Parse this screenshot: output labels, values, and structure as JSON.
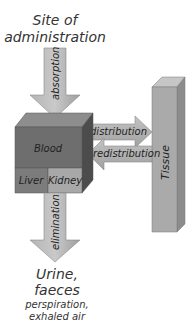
{
  "diagram": {
    "source_label": {
      "line1": "Site of",
      "line2": "administration"
    },
    "arrows": {
      "absorption": "absorption",
      "distribution": "distribution",
      "redistribution": "redistribution",
      "elimination": "elimination"
    },
    "compartments": {
      "blood": "Blood",
      "liver": "Liver",
      "kidney": "Kidney",
      "tissue": "Tissue"
    },
    "output_label": {
      "line1": "Urine,",
      "line2": "faeces",
      "line3": "perspiration,",
      "line4": "exhaled air"
    },
    "colors": {
      "arrow_fill": "#a9a9a9",
      "arrow_light": "#c8c8c8",
      "blood_front": "#6e6e6e",
      "blood_top": "#8c8c8c",
      "blood_side": "#4e4e4e",
      "liver": "#7a7a7a",
      "kidney": "#a6a6a6",
      "tissue_front": "#a8a8a8",
      "tissue_top": "#c4c4c4",
      "tissue_side": "#8a8a8a"
    }
  }
}
